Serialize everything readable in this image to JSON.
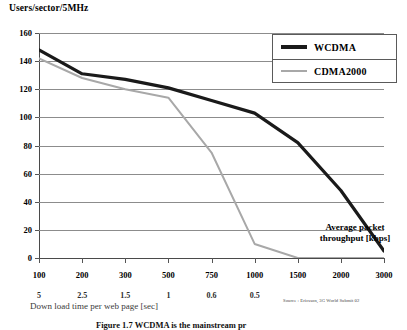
{
  "figure": {
    "y_axis_title": "Users/sector/5MHz",
    "x_axis_title": "Down load time per web page [sec]",
    "annotation": "Average packet throughput [kbps]",
    "source": "Source : Ericsson, 3G World Submit 02",
    "caption": "Figure 1.7   WCDMA is the mainstream pr"
  },
  "legend": {
    "position": "top-right",
    "items": [
      {
        "label": "WCDMA",
        "color": "#1a1a1a",
        "width": 3.2,
        "swatch": "line-swatch-wcdma"
      },
      {
        "label": "CDMA2000",
        "color": "#a8a8a8",
        "width": 2.0,
        "swatch": "line-swatch-cdma2000"
      }
    ]
  },
  "chart_data": {
    "type": "line",
    "title": "Users/sector/5MHz",
    "xlabel": "Down load time per web page [sec]",
    "ylabel": "Users/sector/5MHz",
    "ylim": [
      0,
      160
    ],
    "yticks": [
      0,
      20,
      40,
      60,
      80,
      100,
      120,
      140,
      160
    ],
    "grid": true,
    "x_axis_note": "Average packet throughput [kbps]",
    "categories": [
      "100",
      "200",
      "300",
      "500",
      "750",
      "1000",
      "1500",
      "2000",
      "3000"
    ],
    "secondary_categories": [
      "5",
      "2.5",
      "1.5",
      "1",
      "0.6",
      "0.5",
      "",
      "",
      ""
    ],
    "series": [
      {
        "name": "WCDMA",
        "color": "#1a1a1a",
        "values": [
          148,
          131,
          127,
          121,
          112,
          103,
          82,
          48,
          5
        ]
      },
      {
        "name": "CDMA2000",
        "color": "#a8a8a8",
        "values": [
          142,
          128,
          120,
          114,
          75,
          10,
          0,
          0,
          0
        ]
      }
    ],
    "source": "Source : Ericsson, 3G World Submit 02"
  }
}
